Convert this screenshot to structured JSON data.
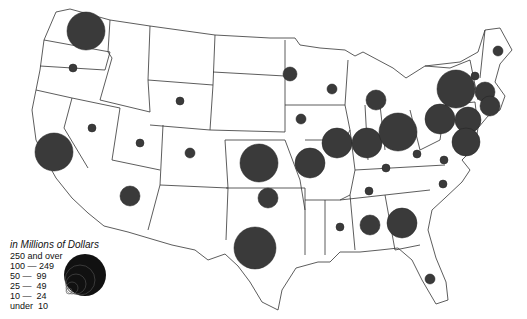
{
  "map": {
    "type": "proportional-symbol",
    "region": "United States (contiguous)",
    "legend": {
      "title": "in Millions of Dollars",
      "classes": [
        "250 and over",
        "100 — 249",
        "50 —  99",
        "25 —  49",
        "10 —  24",
        "under  10"
      ]
    },
    "symbols": [
      {
        "state": "WA",
        "x": 86,
        "y": 31,
        "r": 19,
        "class": "250 and over"
      },
      {
        "state": "OR",
        "x": 73,
        "y": 68,
        "r": 4,
        "class": "under 10"
      },
      {
        "state": "CA",
        "x": 54,
        "y": 152,
        "r": 19,
        "class": "250 and over"
      },
      {
        "state": "NV",
        "x": 92,
        "y": 128,
        "r": 4,
        "class": "under 10"
      },
      {
        "state": "UT",
        "x": 140,
        "y": 143,
        "r": 4,
        "class": "under 10"
      },
      {
        "state": "WY",
        "x": 180,
        "y": 101,
        "r": 4,
        "class": "under 10"
      },
      {
        "state": "CO",
        "x": 190,
        "y": 153,
        "r": 5,
        "class": "under 10"
      },
      {
        "state": "AZ",
        "x": 130,
        "y": 196,
        "r": 10,
        "class": "25 — 49"
      },
      {
        "state": "KS",
        "x": 259,
        "y": 163,
        "r": 19,
        "class": "250 and over"
      },
      {
        "state": "OK",
        "x": 268,
        "y": 198,
        "r": 10,
        "class": "25 — 49"
      },
      {
        "state": "TX",
        "x": 255,
        "y": 248,
        "r": 21,
        "class": "250 and over"
      },
      {
        "state": "MN",
        "x": 290,
        "y": 74,
        "r": 7,
        "class": "10 — 24"
      },
      {
        "state": "IA",
        "x": 301,
        "y": 119,
        "r": 5,
        "class": "under 10"
      },
      {
        "state": "MO",
        "x": 310,
        "y": 163,
        "r": 15,
        "class": "100 — 249"
      },
      {
        "state": "WI",
        "x": 332,
        "y": 89,
        "r": 5,
        "class": "under 10"
      },
      {
        "state": "MI",
        "x": 376,
        "y": 100,
        "r": 10,
        "class": "25 — 49"
      },
      {
        "state": "IL",
        "x": 337,
        "y": 143,
        "r": 15,
        "class": "100 — 249"
      },
      {
        "state": "IN",
        "x": 367,
        "y": 143,
        "r": 15,
        "class": "100 — 249"
      },
      {
        "state": "OH",
        "x": 398,
        "y": 132,
        "r": 19,
        "class": "250 and over"
      },
      {
        "state": "KY",
        "x": 386,
        "y": 168,
        "r": 4,
        "class": "under 10"
      },
      {
        "state": "WV",
        "x": 417,
        "y": 154,
        "r": 4,
        "class": "under 10"
      },
      {
        "state": "VA",
        "x": 444,
        "y": 160,
        "r": 4,
        "class": "under 10"
      },
      {
        "state": "NC",
        "x": 443,
        "y": 184,
        "r": 4,
        "class": "under 10"
      },
      {
        "state": "TN",
        "x": 369,
        "y": 191,
        "r": 4,
        "class": "under 10"
      },
      {
        "state": "MS",
        "x": 340,
        "y": 227,
        "r": 4,
        "class": "under 10"
      },
      {
        "state": "AL",
        "x": 370,
        "y": 225,
        "r": 10,
        "class": "25 — 49"
      },
      {
        "state": "GA",
        "x": 402,
        "y": 223,
        "r": 15,
        "class": "100 — 249"
      },
      {
        "state": "FL",
        "x": 430,
        "y": 279,
        "r": 5,
        "class": "under 10"
      },
      {
        "state": "ME",
        "x": 498,
        "y": 51,
        "r": 5,
        "class": "under 10"
      },
      {
        "state": "NY",
        "x": 456,
        "y": 89,
        "r": 19,
        "class": "250 and over"
      },
      {
        "state": "VT-NH",
        "x": 475,
        "y": 76,
        "r": 4,
        "class": "under 10"
      },
      {
        "state": "MA",
        "x": 485,
        "y": 92,
        "r": 10,
        "class": "25 — 49"
      },
      {
        "state": "CT-RI",
        "x": 490,
        "y": 106,
        "r": 10,
        "class": "50 — 99"
      },
      {
        "state": "PA",
        "x": 440,
        "y": 119,
        "r": 15,
        "class": "100 — 249"
      },
      {
        "state": "NJ",
        "x": 468,
        "y": 120,
        "r": 13,
        "class": "50 — 99"
      },
      {
        "state": "MD-DE",
        "x": 466,
        "y": 142,
        "r": 14,
        "class": "100 — 249"
      }
    ]
  }
}
